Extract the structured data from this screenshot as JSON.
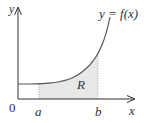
{
  "diagram": {
    "axes": {
      "x_label": "x",
      "y_label": "y",
      "origin_label": "0"
    },
    "curve_label": "y = f(x)",
    "region_label": "R",
    "bounds": {
      "lower": "a",
      "upper": "b"
    },
    "colors": {
      "axis": "#333333",
      "curve": "#555555",
      "region_fill": "#e6e6e6",
      "bound_lines": "#999999"
    }
  }
}
